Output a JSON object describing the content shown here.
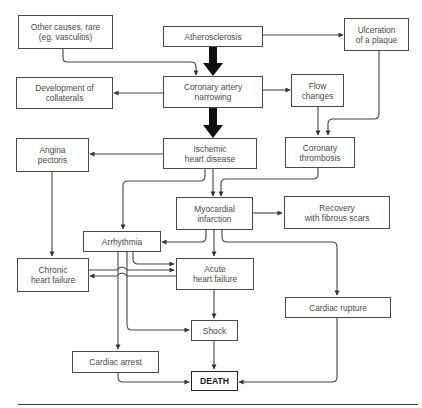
{
  "diagram": {
    "title": "",
    "nodes": [
      {
        "id": "other_causes",
        "label": "Other causes, rare\n(eg. vasculitis)"
      },
      {
        "id": "atherosclerosis",
        "label": "Atherosclerosis"
      },
      {
        "id": "ulceration",
        "label": "Ulceration\nof a plaque"
      },
      {
        "id": "collaterals",
        "label": "Development of\ncollaterals"
      },
      {
        "id": "narrowing",
        "label": "Coronary artery\nnarrowing"
      },
      {
        "id": "flow_changes",
        "label": "Flow\nchanges"
      },
      {
        "id": "angina",
        "label": "Angina\npectoris"
      },
      {
        "id": "ihd",
        "label": "Ischemic\nheart disease"
      },
      {
        "id": "thrombosis",
        "label": "Coronary\nthrombosis"
      },
      {
        "id": "mi",
        "label": "Myocardial\ninfarction"
      },
      {
        "id": "recovery",
        "label": "Recovery\nwith fibrous scars"
      },
      {
        "id": "arrhythmia",
        "label": "Arrhythmia"
      },
      {
        "id": "chronic_hf",
        "label": "Chronic\nheart failure"
      },
      {
        "id": "acute_hf",
        "label": "Acute\nheart failure"
      },
      {
        "id": "rupture",
        "label": "Cardiac rupture"
      },
      {
        "id": "shock",
        "label": "Shock"
      },
      {
        "id": "arrest",
        "label": "Cardiac arrest"
      },
      {
        "id": "death",
        "label": "DEATH"
      }
    ],
    "edges": [
      {
        "from": "atherosclerosis",
        "to": "narrowing",
        "style": "thick"
      },
      {
        "from": "atherosclerosis",
        "to": "ulceration"
      },
      {
        "from": "other_causes",
        "to": "narrowing"
      },
      {
        "from": "narrowing",
        "to": "collaterals"
      },
      {
        "from": "narrowing",
        "to": "flow_changes"
      },
      {
        "from": "narrowing",
        "to": "ihd",
        "style": "thick"
      },
      {
        "from": "flow_changes",
        "to": "thrombosis"
      },
      {
        "from": "ulceration",
        "to": "thrombosis"
      },
      {
        "from": "ihd",
        "to": "angina"
      },
      {
        "from": "ihd",
        "to": "mi"
      },
      {
        "from": "ihd",
        "to": "arrhythmia"
      },
      {
        "from": "thrombosis",
        "to": "mi"
      },
      {
        "from": "mi",
        "to": "recovery"
      },
      {
        "from": "mi",
        "to": "arrhythmia"
      },
      {
        "from": "mi",
        "to": "acute_hf"
      },
      {
        "from": "mi",
        "to": "rupture"
      },
      {
        "from": "angina",
        "to": "chronic_hf"
      },
      {
        "from": "arrhythmia",
        "to": "acute_hf"
      },
      {
        "from": "arrhythmia",
        "to": "shock"
      },
      {
        "from": "arrhythmia",
        "to": "arrest"
      },
      {
        "from": "chronic_hf",
        "to": "acute_hf"
      },
      {
        "from": "acute_hf",
        "to": "chronic_hf"
      },
      {
        "from": "acute_hf",
        "to": "shock"
      },
      {
        "from": "shock",
        "to": "death"
      },
      {
        "from": "arrest",
        "to": "death"
      },
      {
        "from": "rupture",
        "to": "death"
      }
    ]
  }
}
